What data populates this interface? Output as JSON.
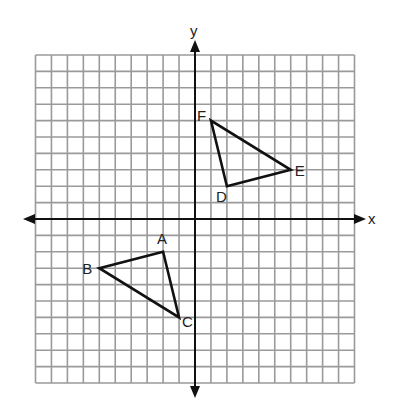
{
  "figure": {
    "type": "coordinate-plane",
    "grid": {
      "xmin": -10,
      "xmax": 10,
      "ymin": -10,
      "ymax": 10,
      "step": 1
    },
    "axes": {
      "x_label": "x",
      "y_label": "y"
    },
    "colors": {
      "grid": "#9a9a9a",
      "axis": "#111111",
      "shape": "#111111",
      "label": "#222222"
    },
    "triangles": [
      {
        "name": "ABC",
        "vertices": [
          {
            "label": "A",
            "x": -2,
            "y": -2
          },
          {
            "label": "B",
            "x": -6,
            "y": -3
          },
          {
            "label": "C",
            "x": -1,
            "y": -6
          }
        ]
      },
      {
        "name": "DEF",
        "vertices": [
          {
            "label": "D",
            "x": 2,
            "y": 2
          },
          {
            "label": "E",
            "x": 6,
            "y": 3
          },
          {
            "label": "F",
            "x": 1,
            "y": 6
          }
        ]
      }
    ]
  }
}
